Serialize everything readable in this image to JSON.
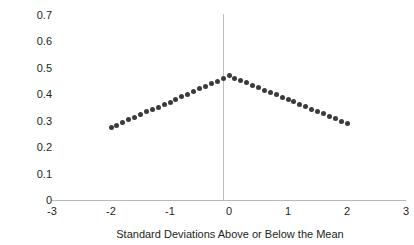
{
  "chart_data": {
    "type": "scatter",
    "title": "",
    "xlabel": "Standard Deviations Above or Below the Mean",
    "ylabel": "Correlation",
    "xlim": [
      -3,
      3
    ],
    "ylim": [
      0,
      0.7
    ],
    "xticks": [
      "-3",
      "-2",
      "-1",
      "0",
      "1",
      "2",
      "3"
    ],
    "xtick_values": [
      -3,
      -2,
      -1,
      0,
      1,
      2,
      3
    ],
    "yticks": [
      "0",
      "0.1",
      "0.2",
      "0.3",
      "0.4",
      "0.5",
      "0.6",
      "0.7"
    ],
    "ytick_values": [
      0,
      0.1,
      0.2,
      0.3,
      0.4,
      0.5,
      0.6,
      0.7
    ],
    "grid": false,
    "legend": "none",
    "marker_color": "#3b3b3b",
    "axis_color": "#b9b9b9",
    "zero_line_color": "#bdbdbd",
    "annotations": [
      "vertical reference line at x = 0"
    ],
    "series": [
      {
        "name": "Correlation by standard deviation from the mean",
        "x": [
          -2.0,
          -1.9,
          -1.8,
          -1.7,
          -1.6,
          -1.5,
          -1.4,
          -1.3,
          -1.2,
          -1.1,
          -1.0,
          -0.9,
          -0.8,
          -0.7,
          -0.6,
          -0.5,
          -0.4,
          -0.3,
          -0.2,
          -0.1,
          0.0,
          0.1,
          0.2,
          0.3,
          0.4,
          0.5,
          0.6,
          0.7,
          0.8,
          0.9,
          1.0,
          1.1,
          1.2,
          1.3,
          1.4,
          1.5,
          1.6,
          1.7,
          1.8,
          1.9,
          2.0
        ],
        "y": [
          0.275,
          0.285,
          0.295,
          0.305,
          0.315,
          0.325,
          0.335,
          0.345,
          0.352,
          0.362,
          0.372,
          0.382,
          0.392,
          0.402,
          0.412,
          0.422,
          0.432,
          0.442,
          0.452,
          0.462,
          0.472,
          0.463,
          0.454,
          0.445,
          0.436,
          0.427,
          0.418,
          0.409,
          0.4,
          0.391,
          0.382,
          0.373,
          0.364,
          0.355,
          0.346,
          0.337,
          0.328,
          0.319,
          0.31,
          0.3,
          0.29
        ]
      }
    ]
  }
}
